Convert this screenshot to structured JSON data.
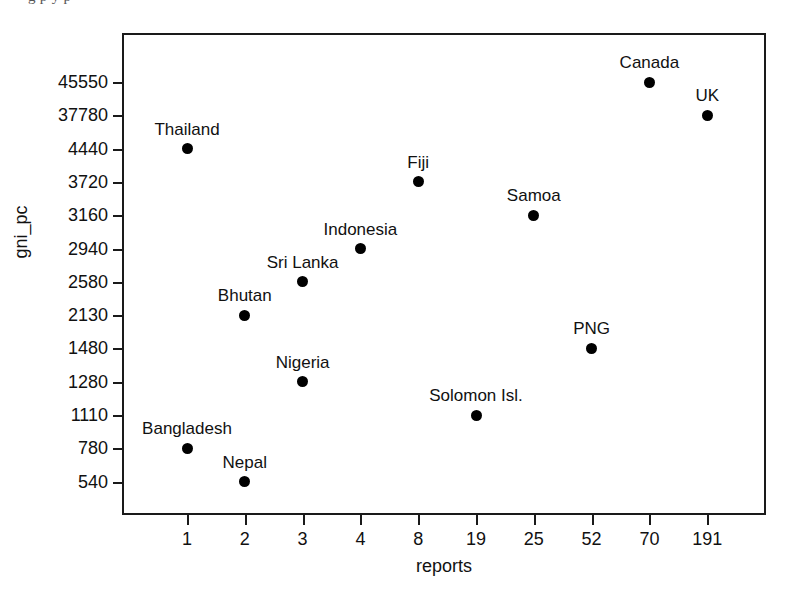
{
  "figure": {
    "clipped_header_sliver": "g p y p",
    "background_color": "#ffffff",
    "marker_color": "#000000",
    "axis_color": "#1a1a1a"
  },
  "chart_data": {
    "type": "scatter",
    "title": "",
    "xlabel": "reports",
    "ylabel": "gni_pc",
    "grid": false,
    "legend": null,
    "x_scale": "categorical-ordinal",
    "y_scale": "categorical-ordinal",
    "x_tick_labels": [
      "1",
      "2",
      "3",
      "4",
      "8",
      "19",
      "25",
      "52",
      "70",
      "191"
    ],
    "y_tick_labels": [
      "45550",
      "37780",
      "4440",
      "3720",
      "3160",
      "2940",
      "2580",
      "2130",
      "1480",
      "1280",
      "1110",
      "780",
      "540"
    ],
    "points": [
      {
        "label": "Canada",
        "x": "70",
        "y": "45550"
      },
      {
        "label": "UK",
        "x": "191",
        "y": "37780"
      },
      {
        "label": "Thailand",
        "x": "1",
        "y": "4440"
      },
      {
        "label": "Fiji",
        "x": "8",
        "y": "3720"
      },
      {
        "label": "Samoa",
        "x": "25",
        "y": "3160"
      },
      {
        "label": "Indonesia",
        "x": "4",
        "y": "2940"
      },
      {
        "label": "Sri Lanka",
        "x": "3",
        "y": "2580"
      },
      {
        "label": "Bhutan",
        "x": "2",
        "y": "2130"
      },
      {
        "label": "PNG",
        "x": "52",
        "y": "1480"
      },
      {
        "label": "Nigeria",
        "x": "3",
        "y": "1280"
      },
      {
        "label": "Solomon Isl.",
        "x": "19",
        "y": "1110"
      },
      {
        "label": "Bangladesh",
        "x": "1",
        "y": "780"
      },
      {
        "label": "Nepal",
        "x": "2",
        "y": "540"
      }
    ]
  }
}
